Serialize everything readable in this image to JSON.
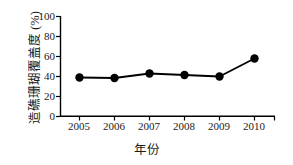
{
  "chart_data": {
    "type": "line",
    "title": "",
    "xlabel": "年份",
    "ylabel": "造礁珊瑚覆盖度 (%)",
    "categories": [
      "2005",
      "2006",
      "2007",
      "2008",
      "2009",
      "2010"
    ],
    "x": [
      2005,
      2006,
      2007,
      2008,
      2009,
      2010
    ],
    "values": [
      39,
      38.5,
      43,
      41.5,
      40,
      58
    ],
    "series": [
      {
        "name": "造礁珊瑚覆盖度",
        "values": [
          39,
          38.5,
          43,
          41.5,
          40,
          58
        ],
        "marker": "filled-circle",
        "color": "#000000"
      }
    ],
    "ylim": [
      0,
      100
    ],
    "yticks": [
      0,
      20,
      40,
      60,
      80,
      100
    ],
    "ytick_labels": [
      "0",
      "20",
      "40",
      "60",
      "80",
      "100"
    ],
    "xticks": [
      2005,
      2006,
      2007,
      2008,
      2009,
      2010
    ],
    "xtick_labels": [
      "2005",
      "2006",
      "2007",
      "2008",
      "2009",
      "2010"
    ],
    "grid": false,
    "legend": false,
    "legend_position": "none",
    "axis_color": "#000000",
    "line_color": "#000000",
    "marker_color": "#000000",
    "background": "#ffffff"
  }
}
